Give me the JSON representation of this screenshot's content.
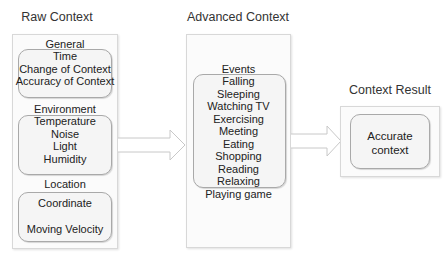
{
  "raw_context": {
    "title": "Raw Context",
    "groups": [
      {
        "header": "General",
        "items": [
          "Time",
          "Change of Context",
          "Accuracy of Context"
        ]
      },
      {
        "header": "Environment",
        "items": [
          "Temperature",
          "Noise",
          "Light",
          "Humidity"
        ]
      },
      {
        "header": "Location",
        "items": [
          "Coordinate",
          "Moving Velocity"
        ]
      }
    ]
  },
  "advanced_context": {
    "title": "Advanced Context",
    "group": {
      "header": "Events",
      "items": [
        "Falling",
        "Sleeping",
        "Watching TV",
        "Exercising",
        "Meeting",
        "Eating",
        "Shopping",
        "Reading",
        "Relaxing",
        "Playing game"
      ]
    }
  },
  "context_result": {
    "title": "Context Result",
    "result_line1": "Accurate",
    "result_line2": "context"
  },
  "colors": {
    "outer_border": "#d8d8d8",
    "inner_border": "#a9a9a9",
    "arrow_stroke": "#c8c8c8",
    "text": "#222222"
  }
}
